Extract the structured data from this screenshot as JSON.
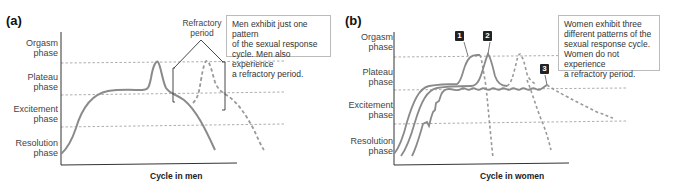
{
  "panel_a": {
    "label": "(a)",
    "phases": [
      "Orgasm phase",
      "Plateau phase",
      "Excitement phase",
      "Resolution phase"
    ],
    "phase_lines": [
      [
        "Orgasm",
        "phase"
      ],
      [
        "Plateau",
        "phase"
      ],
      [
        "Excitement",
        "phase"
      ],
      [
        "Resolution",
        "phase"
      ]
    ],
    "xlabel": "Cycle in men",
    "annotation": "Refractory period",
    "annotation_lines": [
      "Refractory",
      "period"
    ],
    "note": "Men exhibit just one pattern of the sexual response cycle. Men also experience a refractory period.",
    "note_lines": [
      "Men exhibit just one pattern",
      "of the sexual response",
      "cycle. Men also experience",
      "a refractory period."
    ]
  },
  "panel_b": {
    "label": "(b)",
    "phases": [
      "Orgasm phase",
      "Plateau phase",
      "Excitement phase",
      "Resolution phase"
    ],
    "phase_lines": [
      [
        "Orgasm",
        "phase"
      ],
      [
        "Plateau",
        "phase"
      ],
      [
        "Excitement",
        "phase"
      ],
      [
        "Resolution",
        "phase"
      ]
    ],
    "xlabel": "Cycle in women",
    "markers": [
      "1",
      "2",
      "3"
    ],
    "note": "Women exhibit three different patterns of the sexual response cycle. Women do not experience a refractory period.",
    "note_lines": [
      "Women exhibit three",
      "different patterns of the",
      "sexual response cycle.",
      "Women do not experience",
      "a refractory period."
    ]
  },
  "colors": {
    "curve": "#8a8a8a",
    "dashed_guides": "#999999",
    "axis": "#333333",
    "badge_bg": "#222222"
  }
}
